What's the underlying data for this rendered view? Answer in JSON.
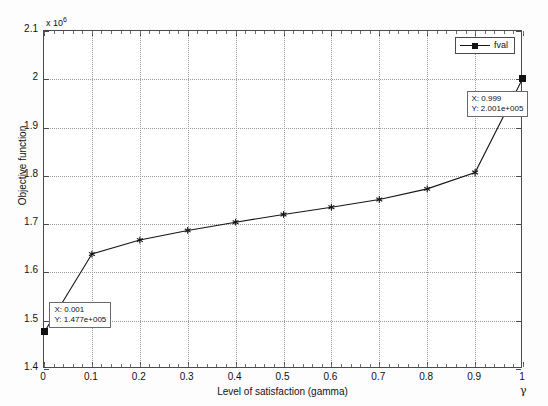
{
  "figure": {
    "background_color": "#fdfdfd",
    "plot_background_color": "#ffffff",
    "axis_color": "#4a4a4a",
    "grid_color": "#9a9a9a",
    "series_color": "#151515"
  },
  "legend": {
    "label": "fval",
    "position": "top-right"
  },
  "axes": {
    "y_exponent_prefix": "x 10",
    "y_exponent_value": "6",
    "y_title": "Objective function",
    "x_title": "Level of satisfaction (gamma)",
    "gamma_glyph": "γ"
  },
  "data_tips": [
    {
      "name": "left-endpoint-tip",
      "x_line": "X: 0.001",
      "y_line": "Y: 1.477e+005"
    },
    {
      "name": "right-endpoint-tip",
      "x_line": "X: 0.999",
      "y_line": "Y: 2.001e+005"
    }
  ],
  "chart_data": {
    "type": "line",
    "title": "",
    "xlabel": "Level of satisfaction (gamma)",
    "ylabel": "Objective function",
    "y_axis_exponent_label": "x 10^6",
    "xlim": [
      0,
      1
    ],
    "ylim": [
      1.4,
      2.1
    ],
    "xticks": [
      0,
      0.1,
      0.2,
      0.3,
      0.4,
      0.5,
      0.6,
      0.7,
      0.8,
      0.9,
      1
    ],
    "xticklabels": [
      "0",
      "0.1",
      "0.2",
      "0.3",
      "0.4",
      "0.5",
      "0.6",
      "0.7",
      "0.8",
      "0.9",
      "1"
    ],
    "yticks": [
      1.4,
      1.5,
      1.6,
      1.7,
      1.8,
      1.9,
      2.0,
      2.1
    ],
    "yticklabels": [
      "1.4",
      "1.5",
      "1.6",
      "1.7",
      "1.8",
      "1.9",
      "2",
      "2.1"
    ],
    "grid": true,
    "legend": [
      "fval"
    ],
    "legend_position": "upper right",
    "marker": "star",
    "series": [
      {
        "name": "fval",
        "x": [
          0.001,
          0.1,
          0.2,
          0.3,
          0.4,
          0.5,
          0.6,
          0.7,
          0.8,
          0.9,
          0.999
        ],
        "y": [
          1.477,
          1.638,
          1.667,
          1.687,
          1.704,
          1.72,
          1.735,
          1.751,
          1.773,
          1.807,
          2.001
        ]
      }
    ],
    "annotations": [
      {
        "x": 0.001,
        "y": 1.477,
        "text": "X: 0.001\nY: 1.477e+005"
      },
      {
        "x": 0.999,
        "y": 2.001,
        "text": "X: 0.999\nY: 2.001e+005"
      }
    ]
  }
}
